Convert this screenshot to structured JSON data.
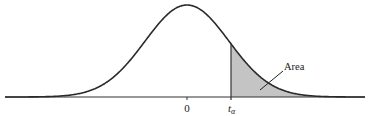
{
  "chart_data": {
    "type": "area",
    "title": "",
    "xlabel": "",
    "ylabel": "",
    "x_tick_labels": [
      "0",
      "t_α"
    ],
    "annotation": "Area",
    "shaded_region": "x ≥ t_α (right tail)",
    "grid": false,
    "legend": null,
    "geometry": {
      "center_px": 187,
      "baseline_px": 97,
      "peak_px": 5,
      "sigma_px": 42,
      "x_start_px": 5,
      "x_end_px": 365,
      "t_alpha_px": 231
    }
  },
  "labels": {
    "zero": "0",
    "t_alpha_main": "t",
    "t_alpha_sub": "α",
    "area": "Area"
  },
  "colors": {
    "curve": "#2a2a2a",
    "shade": "#c4c4c4",
    "axis": "#333333"
  }
}
